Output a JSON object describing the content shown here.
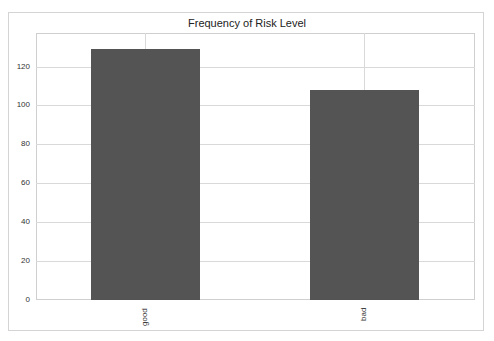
{
  "chart_data": {
    "type": "bar",
    "title": "Frequency of Risk Level",
    "xlabel": "",
    "ylabel": "",
    "categories": [
      "good",
      "bad"
    ],
    "values": [
      129,
      108
    ],
    "ylim": [
      0,
      137
    ],
    "yticks": [
      0,
      20,
      40,
      60,
      80,
      100,
      120
    ],
    "ytick_labels": [
      "0",
      "20",
      "40",
      "60",
      "80",
      "100",
      "120"
    ],
    "grid": true,
    "legend": null,
    "bar_color": "#545454"
  }
}
